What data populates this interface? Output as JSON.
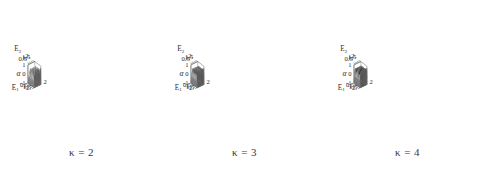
{
  "figure": {
    "background": "#ffffff",
    "panel_count": 3
  },
  "chart_data": [
    {
      "type": "surface",
      "title": "",
      "caption": "κ = 2",
      "kappa": 2,
      "xlabel": "E₁",
      "ylabel": "E₂",
      "zlabel": "α",
      "xticks": [
        "0.5",
        "1.",
        "1.5",
        "2."
      ],
      "yticks": [
        "0.5",
        "1.",
        "1.5",
        "2."
      ],
      "zticks": [
        "1",
        "0",
        "-1"
      ],
      "xlim": [
        0,
        2
      ],
      "ylim": [
        0,
        2
      ],
      "zlim": [
        -1,
        1
      ],
      "grid": false,
      "legend": "none",
      "teeth_count": 4,
      "description": "Sawtooth ramp surface over E1-E2 plane, 4 steps along each axis",
      "surface_light": "#c9c9c9",
      "surface_dark": "#565656"
    },
    {
      "type": "surface",
      "title": "",
      "caption": "κ = 3",
      "kappa": 3,
      "xlabel": "E₁",
      "ylabel": "E₂",
      "zlabel": "α",
      "xticks": [
        "0.5",
        "1.",
        "1.5",
        "2."
      ],
      "yticks": [
        "0.5",
        "1.",
        "1.5",
        "2."
      ],
      "zticks": [
        "1",
        "0",
        "-1"
      ],
      "xlim": [
        0,
        2
      ],
      "ylim": [
        0,
        2
      ],
      "zlim": [
        -1,
        1
      ],
      "grid": false,
      "legend": "none",
      "teeth_count": 6,
      "description": "Sawtooth ramp surface over E1-E2 plane, 6 steps along each axis",
      "surface_light": "#c9c9c9",
      "surface_dark": "#565656"
    },
    {
      "type": "surface",
      "title": "",
      "caption": "κ = 4",
      "kappa": 4,
      "xlabel": "E₁",
      "ylabel": "E₂",
      "zlabel": "α",
      "xticks": [
        "0.5",
        "1.",
        "1.5",
        "2."
      ],
      "yticks": [
        "0.5",
        "1.",
        "1.5",
        "2."
      ],
      "zticks": [
        "1",
        "0",
        "-1"
      ],
      "xlim": [
        0,
        2
      ],
      "ylim": [
        0,
        2
      ],
      "zlim": [
        -1,
        1
      ],
      "grid": false,
      "legend": "none",
      "teeth_count": 8,
      "description": "Sawtooth ramp surface over E1-E2 plane, 8 steps along each axis",
      "surface_light": "#c9c9c9",
      "surface_dark": "#565656"
    }
  ]
}
